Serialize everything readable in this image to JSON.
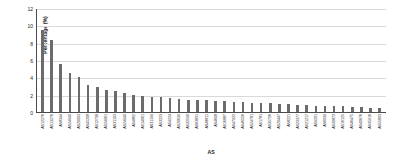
{
  "chart_data": {
    "type": "bar",
    "title": "",
    "xlabel": "AS",
    "ylabel": "Percentage (%)",
    "ylim": [
      0,
      12
    ],
    "yticks": [
      0,
      2,
      4,
      6,
      8,
      10,
      12
    ],
    "ytick_labels": [
      "0",
      "2",
      "4",
      "6",
      "8",
      "10",
      "12"
    ],
    "grid": true,
    "grid_axis": "y",
    "legend": false,
    "bar_color": "#6b6b6b",
    "categories": [
      "AS12276",
      "AS13276",
      "AS8344",
      "AS24940",
      "AS20003",
      "AS45208",
      "AS12738",
      "AS24961",
      "AS31103",
      "AS24940",
      "AS4862",
      "AS14061",
      "AS31199",
      "AS3223",
      "AS4224",
      "AS20639",
      "AS32590",
      "AS63831",
      "AS48811",
      "AS4608",
      "AS16887",
      "AS47922",
      "AS46556",
      "AS24781",
      "AS1781",
      "AS35726",
      "AS20447",
      "AS8221",
      "AS23377",
      "AS21217",
      "AS9201",
      "AS6939",
      "AS30873",
      "AS16125",
      "AS46475",
      "AS40676",
      "AS35916",
      "AS55803"
    ],
    "values": [
      9.6,
      8.4,
      5.6,
      4.5,
      4.1,
      3.2,
      2.9,
      2.6,
      2.4,
      2.2,
      2.0,
      1.9,
      1.8,
      1.7,
      1.6,
      1.5,
      1.45,
      1.4,
      1.35,
      1.3,
      1.25,
      1.2,
      1.15,
      1.1,
      1.05,
      1.0,
      0.95,
      0.9,
      0.85,
      0.8,
      0.75,
      0.7,
      0.68,
      0.65,
      0.6,
      0.55,
      0.5,
      0.45
    ]
  }
}
